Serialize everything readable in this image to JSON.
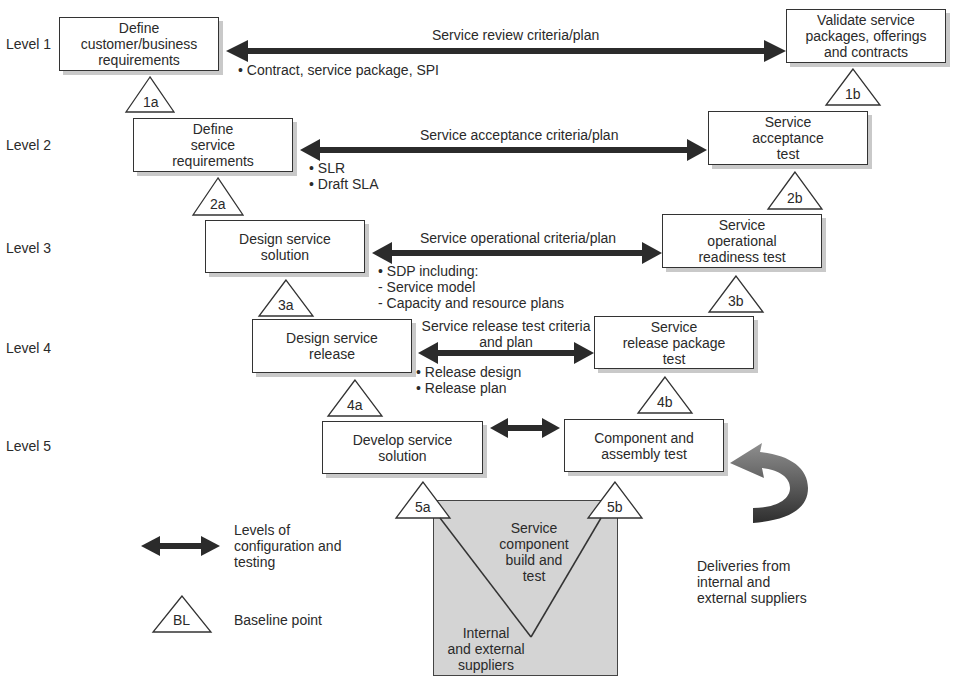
{
  "levels": [
    {
      "label": "Level 1",
      "y": 36
    },
    {
      "label": "Level 2",
      "y": 137
    },
    {
      "label": "Level 3",
      "y": 240
    },
    {
      "label": "Level 4",
      "y": 340
    },
    {
      "label": "Level 5",
      "y": 438
    }
  ],
  "left_boxes": [
    {
      "id": "L1",
      "text": "Define\ncustomer/business\nrequirements"
    },
    {
      "id": "L2",
      "text": "Define\nservice\nrequirements"
    },
    {
      "id": "L3",
      "text": "Design service\nsolution"
    },
    {
      "id": "L4",
      "text": "Design service\nrelease"
    },
    {
      "id": "L5",
      "text": "Develop service\nsolution"
    }
  ],
  "right_boxes": [
    {
      "id": "R1",
      "text": "Validate service\npackages, offerings\nand contracts"
    },
    {
      "id": "R2",
      "text": "Service\nacceptance\ntest"
    },
    {
      "id": "R3",
      "text": "Service\noperational\nreadiness test"
    },
    {
      "id": "R4",
      "text": "Service\nrelease package\ntest"
    },
    {
      "id": "R5",
      "text": "Component and\nassembly test"
    }
  ],
  "arrows": [
    {
      "label": "Service review criteria/plan",
      "notes": "• Contract, service package, SPI"
    },
    {
      "label": "Service acceptance criteria/plan",
      "notes": "• SLR\n• Draft SLA"
    },
    {
      "label": "Service operational criteria/plan",
      "notes": "• SDP including:\n- Service model\n- Capacity and resource plans"
    },
    {
      "label": "Service release test criteria\nand plan",
      "notes": "• Release design\n• Release plan"
    },
    {
      "label": "",
      "notes": ""
    }
  ],
  "baselines": [
    "1a",
    "1b",
    "2a",
    "2b",
    "3a",
    "3b",
    "4a",
    "4b",
    "5a",
    "5b"
  ],
  "bottom": {
    "v_label": "Service\ncomponent\nbuild and\ntest",
    "suppliers_label": "Internal\nand external\nsuppliers",
    "deliveries_label": "Deliveries from\ninternal and\nexternal suppliers"
  },
  "legend": {
    "arrow_label": "Levels of\nconfiguration and\ntesting",
    "baseline_symbol": "BL",
    "baseline_label": "Baseline point"
  },
  "colors": {
    "arrow": "#2b2b2b",
    "shadow": "#c9c9c9",
    "gray_box": "#d4d4d4",
    "curved_arrow_light": "#8a8a8a",
    "curved_arrow_dark": "#333333"
  }
}
